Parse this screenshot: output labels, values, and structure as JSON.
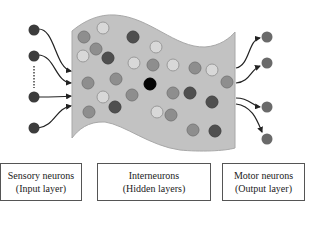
{
  "colors": {
    "sheet_fill": "#c2c2c2",
    "sheet_stroke": "#a8a8a8",
    "neuron_input": "#3c3c3c",
    "neuron_output": "#6a6a6a",
    "neuron_dark": "#4f4f4f",
    "neuron_mid": "#8e8e8e",
    "neuron_light": "#d8d8d8",
    "neuron_black": "#050505",
    "arrow": "#222222",
    "box_border": "#555555"
  },
  "labels": {
    "input": {
      "line1": "Sensory neurons",
      "line2": "(Input layer)"
    },
    "hidden": {
      "line1": "Interneurons",
      "line2": "(Hidden layers)"
    },
    "output": {
      "line1": "Motor neurons",
      "line2": "(Output layer)"
    }
  },
  "input_neurons": [
    {
      "x": 34,
      "y": 30
    },
    {
      "x": 34,
      "y": 56
    },
    {
      "x": 34,
      "y": 97
    },
    {
      "x": 34,
      "y": 128
    }
  ],
  "output_neurons": [
    {
      "x": 267,
      "y": 37
    },
    {
      "x": 267,
      "y": 63
    },
    {
      "x": 267,
      "y": 107
    },
    {
      "x": 267,
      "y": 139
    }
  ],
  "hidden_neurons": [
    {
      "x": 84,
      "y": 37,
      "tone": "mid"
    },
    {
      "x": 103,
      "y": 28,
      "tone": "light"
    },
    {
      "x": 133,
      "y": 37,
      "tone": "dark"
    },
    {
      "x": 83,
      "y": 56,
      "tone": "light"
    },
    {
      "x": 96,
      "y": 49,
      "tone": "mid"
    },
    {
      "x": 108,
      "y": 58,
      "tone": "dark"
    },
    {
      "x": 134,
      "y": 63,
      "tone": "light"
    },
    {
      "x": 156,
      "y": 47,
      "tone": "light"
    },
    {
      "x": 153,
      "y": 65,
      "tone": "mid"
    },
    {
      "x": 173,
      "y": 65,
      "tone": "light"
    },
    {
      "x": 195,
      "y": 68,
      "tone": "mid"
    },
    {
      "x": 212,
      "y": 70,
      "tone": "light"
    },
    {
      "x": 227,
      "y": 82,
      "tone": "mid"
    },
    {
      "x": 88,
      "y": 83,
      "tone": "mid"
    },
    {
      "x": 116,
      "y": 79,
      "tone": "mid"
    },
    {
      "x": 103,
      "y": 97,
      "tone": "light"
    },
    {
      "x": 132,
      "y": 95,
      "tone": "mid"
    },
    {
      "x": 150,
      "y": 84,
      "tone": "black"
    },
    {
      "x": 173,
      "y": 93,
      "tone": "mid"
    },
    {
      "x": 190,
      "y": 93,
      "tone": "dark"
    },
    {
      "x": 212,
      "y": 102,
      "tone": "dark"
    },
    {
      "x": 89,
      "y": 112,
      "tone": "mid"
    },
    {
      "x": 115,
      "y": 107,
      "tone": "dark"
    },
    {
      "x": 157,
      "y": 112,
      "tone": "light"
    },
    {
      "x": 171,
      "y": 115,
      "tone": "mid"
    },
    {
      "x": 193,
      "y": 130,
      "tone": "mid"
    },
    {
      "x": 215,
      "y": 131,
      "tone": "dark"
    }
  ]
}
